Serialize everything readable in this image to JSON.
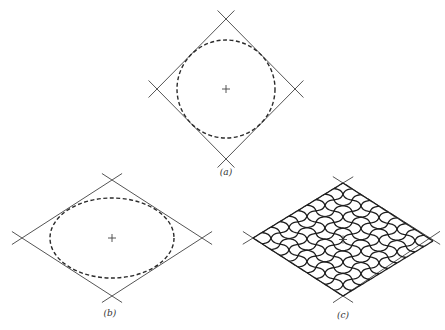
{
  "figures": [
    {
      "id": "a",
      "label": "(a)",
      "description": "Square rotated 45 degrees with inscribed dashed circle and center mark",
      "rhombus": {
        "top": [
          226,
          19
        ],
        "right": [
          295,
          89
        ],
        "bottom": [
          226,
          159
        ],
        "left": [
          157,
          89
        ]
      },
      "curve": {
        "type": "circle",
        "cx": 226,
        "cy": 89,
        "r": 49
      },
      "label_pos": [
        226,
        175
      ]
    },
    {
      "id": "b",
      "label": "(b)",
      "description": "Rhombus with inscribed dashed ellipse and center mark",
      "rhombus": {
        "top": [
          112,
          180
        ],
        "right": [
          202,
          238
        ],
        "bottom": [
          112,
          296
        ],
        "left": [
          22,
          238
        ]
      },
      "curve": {
        "type": "ellipse",
        "cx": 112,
        "cy": 238,
        "rx": 62,
        "ry": 40
      },
      "label_pos": [
        110,
        316
      ]
    },
    {
      "id": "c",
      "label": "(c)",
      "description": "Rhombus filled with a distorted mesh of ellipses",
      "rhombus": {
        "top": [
          343,
          183
        ],
        "right": [
          430,
          238
        ],
        "bottom": [
          343,
          296
        ],
        "left": [
          253,
          238
        ]
      },
      "mesh_divisions": 10,
      "label_pos": [
        343,
        318
      ]
    }
  ]
}
